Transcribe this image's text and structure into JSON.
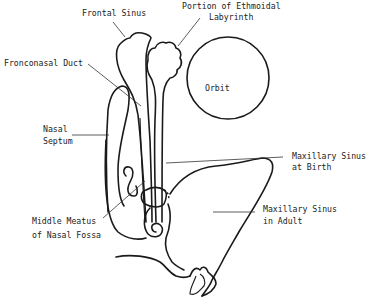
{
  "diagram": {
    "labels": {
      "frontal_sinus": "Frontal Sinus",
      "ethmoid_line1": "Portion of Ethmoidal",
      "ethmoid_line2": "Labyrinth",
      "frontonasal_duct": "Fronconasal Duct",
      "orbit": "Orbit",
      "nasal_septum_line1": "Nasal",
      "nasal_septum_line2": "Septum",
      "max_birth_line1": "Maxillary Sinus",
      "max_birth_line2": "at Birth",
      "middle_meatus_line1": "Middle Meatus",
      "middle_meatus_line2": "of Nasal Fossa",
      "max_adult_line1": "Maxillary Sinus",
      "max_adult_line2": "in Adult"
    },
    "colors": {
      "stroke": "#1a1a1a",
      "text": "#222222",
      "background": "#ffffff"
    }
  }
}
